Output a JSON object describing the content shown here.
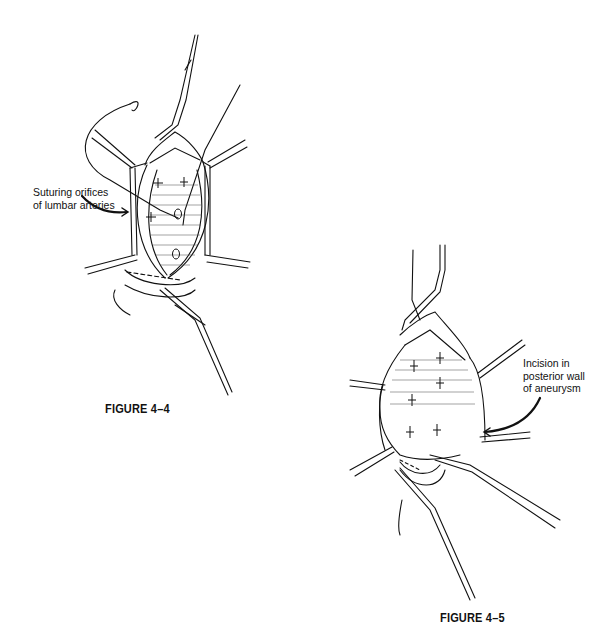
{
  "figures": [
    {
      "id": "4-4",
      "caption": "FIGURE 4–4",
      "annotation": {
        "line1": "Suturing orifices",
        "line2": "of lumbar arteries"
      }
    },
    {
      "id": "4-5",
      "caption": "FIGURE 4–5",
      "annotation": {
        "line1": "Incision in",
        "line2": "posterior wall",
        "line3": "of aneurysm"
      }
    }
  ]
}
